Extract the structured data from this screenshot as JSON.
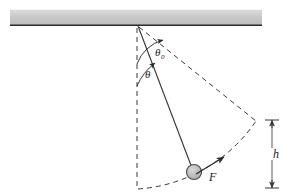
{
  "figure": {
    "type": "physics-diagram",
    "width": 299,
    "height": 196,
    "background_color": "#ffffff"
  },
  "ceiling": {
    "name": "ceiling-support-bar",
    "x": 10,
    "y": 10,
    "width": 252,
    "height": 15,
    "fill_color": "#c9c9c9",
    "edge_color": "#2b2b2b"
  },
  "pivot": {
    "name": "pivot-point",
    "x": 138,
    "y": 26
  },
  "rod": {
    "name": "pendulum-rod",
    "x1": 138,
    "y1": 26,
    "x2": 192,
    "y2": 168,
    "color": "#3a3a3a",
    "style": "solid"
  },
  "bob": {
    "name": "pendulum-bob",
    "cx": 194,
    "cy": 172,
    "r": 7.5,
    "fill_color": "#b8b8b8",
    "stroke_color": "#4a4a4a"
  },
  "vertical_reference": {
    "name": "vertical-dashed-reference-line",
    "x1": 137,
    "y1": 28,
    "x2": 137,
    "y2": 190,
    "style": "dashed",
    "color": "#3a3a3a"
  },
  "max_swing_line": {
    "name": "maximum-displacement-dashed-line",
    "x1": 139,
    "y1": 27,
    "x2": 256,
    "y2": 121,
    "style": "dashed",
    "color": "#3a3a3a"
  },
  "arc": {
    "name": "swing-path-dashed-arc",
    "style": "dashed",
    "color": "#3a3a3a",
    "start_x": 138,
    "start_y": 189,
    "end_x": 256,
    "end_y": 121
  },
  "force_vector": {
    "name": "force-vector-F",
    "x1": 196,
    "y1": 174,
    "x2": 224,
    "y2": 157,
    "color": "#2b2b2b",
    "label": "F",
    "label_x": 209,
    "label_y": 181
  },
  "angles": [
    {
      "name": "angle-theta-zero",
      "label": "θ",
      "subscript": "0",
      "label_x": 155,
      "label_y": 56,
      "description": "maximum angular displacement from vertical"
    },
    {
      "name": "angle-theta",
      "label": "θ",
      "subscript": "",
      "label_x": 145,
      "label_y": 78,
      "description": "instantaneous angular displacement from vertical"
    }
  ],
  "height_dimension": {
    "name": "height-dimension-h",
    "label": "h",
    "x": 272,
    "y_top": 120,
    "y_bottom": 188,
    "cap_half_width": 7,
    "label_x": 277,
    "label_y": 158,
    "color": "#3a3a3a"
  }
}
